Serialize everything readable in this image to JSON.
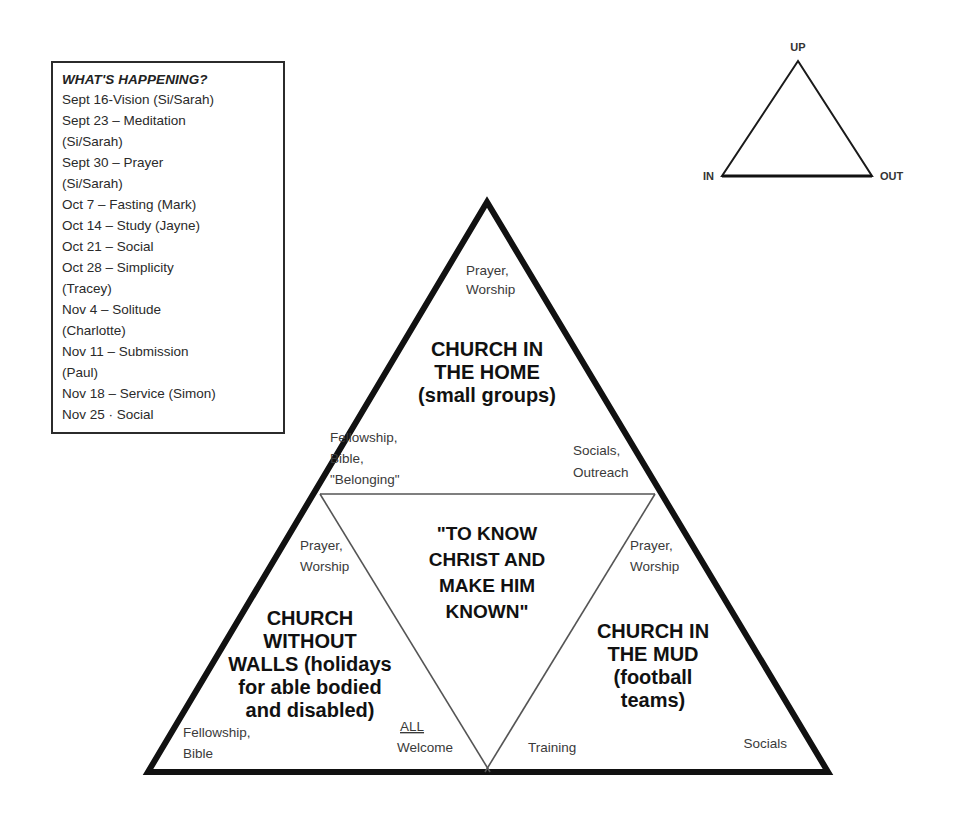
{
  "schedule": {
    "title": "WHAT'S HAPPENING?",
    "items": [
      "Sept 16-Vision (Si/Sarah)",
      "Sept 23 – Meditation",
      "(Si/Sarah)",
      "Sept 30 – Prayer",
      "(Si/Sarah)",
      "Oct 7 – Fasting (Mark)",
      "Oct 14 – Study (Jayne)",
      "Oct 21 – Social",
      "Oct 28 – Simplicity",
      "(Tracey)",
      "Nov 4 – Solitude",
      "(Charlotte)",
      "Nov 11 – Submission",
      "(Paul)",
      "Nov 18 – Service (Simon)",
      "Nov 25 · Social"
    ]
  },
  "compass_triangle": {
    "apex_label": "UP",
    "left_label": "IN",
    "right_label": "OUT"
  },
  "main_triangle": {
    "top_section": {
      "corner_label_lines": [
        "Prayer,",
        "Worship"
      ],
      "title_lines": [
        "CHURCH IN",
        "THE HOME",
        "(small groups)"
      ],
      "left_base_label_lines": [
        "Fellowship,",
        "Bible,",
        "\"Belonging\""
      ],
      "right_base_label_lines": [
        "Socials,",
        "Outreach"
      ]
    },
    "center_section": {
      "title_lines": [
        "\"TO KNOW",
        "CHRIST AND",
        "MAKE HIM",
        "KNOWN\""
      ]
    },
    "left_section": {
      "corner_label_lines": [
        "Prayer,",
        "Worship"
      ],
      "title_lines": [
        "CHURCH",
        "WITHOUT",
        "WALLS (holidays",
        "for able bodied",
        "and disabled)"
      ],
      "base_left_label_lines": [
        "Fellowship,",
        "Bible"
      ],
      "base_right_label_emphasis": "ALL",
      "base_right_label_rest": "Welcome"
    },
    "right_section": {
      "corner_label_lines": [
        "Prayer,",
        "Worship"
      ],
      "title_lines": [
        "CHURCH IN",
        "THE MUD",
        "(football",
        "teams)"
      ],
      "base_left_label": "Training",
      "base_right_label": "Socials"
    }
  },
  "colors": {
    "outline": "#111111",
    "inner_line": "#4a4a4a",
    "text": "#1c1c1c",
    "muted_text": "#3a3a3a",
    "background": "#ffffff"
  }
}
